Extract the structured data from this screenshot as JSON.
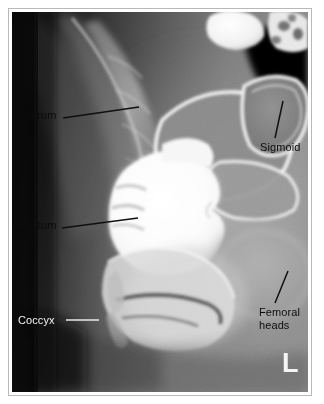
{
  "figure": {
    "modality": "radiograph",
    "study": "Barium enema — lateral rectum view",
    "laterality_marker": "L",
    "background_color": "#ffffff",
    "frame_color": "#b9b9b9",
    "plate_dark_color": "#0b0b0b",
    "contrast_bright_color": "#fdfdfd"
  },
  "annotations": [
    {
      "id": "sacrum",
      "label": "Sacrum",
      "text_color": "#0d0d0d",
      "leader_color": "#101010",
      "leader": {
        "x1": 63,
        "y1": 118,
        "x2": 139,
        "y2": 107
      }
    },
    {
      "id": "rectum",
      "label": "Rectum",
      "text_color": "#0d0d0d",
      "leader_color": "#101010",
      "leader": {
        "x1": 62,
        "y1": 228,
        "x2": 138,
        "y2": 218
      }
    },
    {
      "id": "coccyx",
      "label": "Coccyx",
      "text_color": "#f2f2f2",
      "leader_color": "#e8e8e8",
      "leader": {
        "x1": 66,
        "y1": 320,
        "x2": 99,
        "y2": 320
      }
    },
    {
      "id": "sigmoid",
      "label": "Sigmoid",
      "text_color": "#0d0d0d",
      "leader_color": "#101010",
      "leader": {
        "x1": 283,
        "y1": 101,
        "x2": 275,
        "y2": 138
      }
    },
    {
      "id": "femoral-heads",
      "label": "Femoral\nheads",
      "line1": "Femoral",
      "line2": "heads",
      "text_color": "#0d0d0d",
      "leader_color": "#101010",
      "leader": {
        "x1": 288,
        "y1": 271,
        "x2": 275,
        "y2": 303
      }
    }
  ]
}
